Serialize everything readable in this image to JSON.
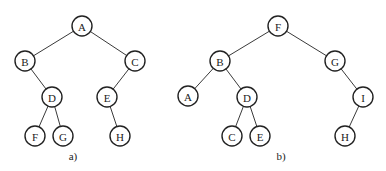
{
  "figure": {
    "trees": [
      {
        "id": "a",
        "caption": "a)",
        "caption_pos": [
          73,
          160
        ],
        "nodes": [
          {
            "id": "A",
            "label": "A",
            "x": 82,
            "y": 26
          },
          {
            "id": "B",
            "label": "B",
            "x": 25,
            "y": 61
          },
          {
            "id": "C",
            "label": "C",
            "x": 135,
            "y": 61
          },
          {
            "id": "D",
            "label": "D",
            "x": 52,
            "y": 97
          },
          {
            "id": "E",
            "label": "E",
            "x": 107,
            "y": 97
          },
          {
            "id": "F",
            "label": "F",
            "x": 35,
            "y": 136
          },
          {
            "id": "G",
            "label": "G",
            "x": 63,
            "y": 136
          },
          {
            "id": "H",
            "label": "H",
            "x": 120,
            "y": 136
          }
        ],
        "edges": [
          [
            "A",
            "B"
          ],
          [
            "A",
            "C"
          ],
          [
            "B",
            "D"
          ],
          [
            "C",
            "E"
          ],
          [
            "D",
            "F"
          ],
          [
            "D",
            "G"
          ],
          [
            "E",
            "H"
          ]
        ]
      },
      {
        "id": "b",
        "caption": "b)",
        "caption_pos": [
          281,
          160
        ],
        "nodes": [
          {
            "id": "F",
            "label": "F",
            "x": 278,
            "y": 26
          },
          {
            "id": "B",
            "label": "B",
            "x": 220,
            "y": 61
          },
          {
            "id": "G",
            "label": "G",
            "x": 335,
            "y": 61
          },
          {
            "id": "A",
            "label": "A",
            "x": 188,
            "y": 96
          },
          {
            "id": "D",
            "label": "D",
            "x": 247,
            "y": 97
          },
          {
            "id": "I",
            "label": "I",
            "x": 363,
            "y": 97
          },
          {
            "id": "C",
            "label": "C",
            "x": 232,
            "y": 136
          },
          {
            "id": "E",
            "label": "E",
            "x": 260,
            "y": 136
          },
          {
            "id": "H",
            "label": "H",
            "x": 345,
            "y": 136
          }
        ],
        "edges": [
          [
            "F",
            "B"
          ],
          [
            "F",
            "G"
          ],
          [
            "B",
            "A"
          ],
          [
            "B",
            "D"
          ],
          [
            "D",
            "C"
          ],
          [
            "D",
            "E"
          ],
          [
            "G",
            "I"
          ],
          [
            "I",
            "H"
          ]
        ]
      }
    ],
    "node_radius": 10
  }
}
